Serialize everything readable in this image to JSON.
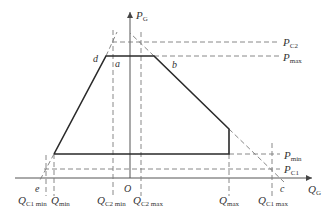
{
  "diagram": {
    "type": "PQ operating region (generator P-Q capability diagram)",
    "axes": {
      "x_label": {
        "main": "Q",
        "sub": "G"
      },
      "y_label": {
        "main": "P",
        "sub": "G"
      },
      "origin_label": "O"
    },
    "points": {
      "a": "a",
      "b": "b",
      "c": "c",
      "d": "d",
      "e": "e"
    },
    "right_labels": {
      "pc2": {
        "main": "P",
        "sub": "C2"
      },
      "pmax": {
        "main": "P",
        "sub": "max"
      },
      "pmin": {
        "main": "P",
        "sub": "min"
      },
      "pc1": {
        "main": "P",
        "sub": "C1"
      }
    },
    "bottom_labels": {
      "qc1min": {
        "main": "Q",
        "sub": "C1 min"
      },
      "qmin": {
        "main": "Q",
        "sub": "min"
      },
      "qc2min": {
        "main": "Q",
        "sub": "C2 min"
      },
      "qc2max": {
        "main": "Q",
        "sub": "C2 max"
      },
      "qmax": {
        "main": "Q",
        "sub": "max"
      },
      "qc1max": {
        "main": "Q",
        "sub": "C1 max"
      }
    },
    "colors": {
      "solid": "#2a2a2a",
      "dashed": "#7a7a7a",
      "axis": "#555555"
    }
  }
}
